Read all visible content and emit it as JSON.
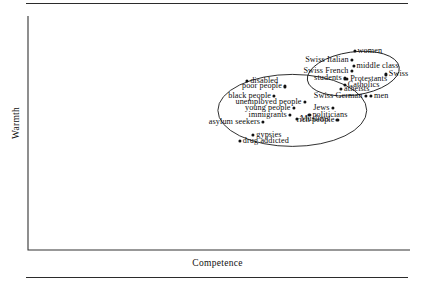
{
  "figure": {
    "background": "#ffffff",
    "ink_color": "#111111",
    "top_rule": true,
    "bottom_rule": true
  },
  "axes": {
    "x_label": "Competence",
    "y_label": "Warmth",
    "x_ticks": [],
    "y_ticks": [],
    "grid": false,
    "spines": [
      "left",
      "bottom"
    ]
  },
  "chart_data": {
    "type": "scatter",
    "title": "",
    "xlabel": "Competence",
    "ylabel": "Warmth",
    "xlim": [
      0,
      100
    ],
    "ylim": [
      0,
      100
    ],
    "grid": false,
    "legend": "none",
    "note": "Stereotype Content Model map of social groups in Switzerland; x and y are unlabeled ordinal axes, values estimated from pixel positions (0-100 scale, y increasing upward).",
    "points": [
      {
        "label": "women",
        "x": 83.0,
        "y": 90.5,
        "label_side": "right"
      },
      {
        "label": "Swiss Italian",
        "x": 81.8,
        "y": 85.0,
        "label_side": "left"
      },
      {
        "label": "middle class",
        "x": 82.6,
        "y": 81.5,
        "label_side": "right"
      },
      {
        "label": "Swiss French",
        "x": 81.8,
        "y": 78.0,
        "label_side": "left"
      },
      {
        "label": "students",
        "x": 79.0,
        "y": 73.5,
        "label_side": "left"
      },
      {
        "label": "Protestants",
        "x": 80.0,
        "y": 73.0,
        "label_side": "right"
      },
      {
        "label": "Swiss",
        "x": 95.8,
        "y": 76.0,
        "label_side": "right"
      },
      {
        "label": "Catholics",
        "x": 79.0,
        "y": 69.5,
        "label_side": "right"
      },
      {
        "label": "atheists",
        "x": 77.5,
        "y": 67.0,
        "label_side": "right"
      },
      {
        "label": "Swiss German",
        "x": 87.5,
        "y": 62.5,
        "label_side": "left"
      },
      {
        "label": "men",
        "x": 89.8,
        "y": 62.5,
        "label_side": "right"
      },
      {
        "label": "disabled",
        "x": 39.0,
        "y": 72.0,
        "label_side": "right"
      },
      {
        "label": "poor people",
        "x": 54.5,
        "y": 68.5,
        "label_side": "left"
      },
      {
        "label": "black people",
        "x": 50.0,
        "y": 62.5,
        "label_side": "left"
      },
      {
        "label": "unemployed people",
        "x": 62.5,
        "y": 59.0,
        "label_side": "left"
      },
      {
        "label": "young people",
        "x": 58.0,
        "y": 55.0,
        "label_side": "left"
      },
      {
        "label": "Jews",
        "x": 74.0,
        "y": 55.0,
        "label_side": "left"
      },
      {
        "label": "immigrants",
        "x": 56.5,
        "y": 50.5,
        "label_side": "left"
      },
      {
        "label": "politicians",
        "x": 64.5,
        "y": 50.5,
        "label_side": "right"
      },
      {
        "label": "Muslims",
        "x": 59.5,
        "y": 48.0,
        "label_side": "right"
      },
      {
        "label": "rich people",
        "x": 76.0,
        "y": 47.5,
        "label_side": "left"
      },
      {
        "label": "asylum seekers",
        "x": 45.5,
        "y": 46.5,
        "label_side": "left"
      },
      {
        "label": "gypsies",
        "x": 41.5,
        "y": 38.0,
        "label_side": "right"
      },
      {
        "label": "drug addicted",
        "x": 36.0,
        "y": 34.5,
        "label_side": "right"
      }
    ],
    "clusters": [
      {
        "name": "high-competence high-warmth cluster",
        "shape": "ellipse",
        "cx": 82.5,
        "cy": 76.5,
        "rx": 19.0,
        "ry": 13.5,
        "rotation_deg": -8
      },
      {
        "name": "low-competence cluster",
        "shape": "ellipse",
        "cx": 57.5,
        "cy": 53.5,
        "rx": 30.5,
        "ry": 22.5,
        "rotation_deg": 0
      }
    ]
  }
}
